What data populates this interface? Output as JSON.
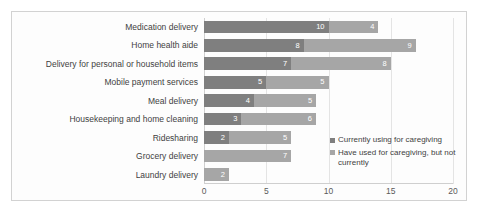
{
  "chart_data": {
    "type": "bar",
    "orientation": "horizontal",
    "stacked": true,
    "title": "",
    "subtitle": "",
    "xlabel": "",
    "ylabel": "",
    "xlim": [
      0,
      20
    ],
    "xticks": [
      0,
      5,
      10,
      15,
      20
    ],
    "grid": true,
    "legend_position": "inside-right",
    "categories": [
      "Medication delivery",
      "Home health aide",
      "Delivery for personal or household items",
      "Mobile payment services",
      "Meal delivery",
      "Housekeeping and home cleaning",
      "Ridesharing",
      "Grocery delivery",
      "Laundry delivery"
    ],
    "series": [
      {
        "name": "Currently using for caregiving",
        "color": "#7f7f7f",
        "values": [
          10,
          8,
          7,
          5,
          4,
          3,
          2,
          0,
          0
        ],
        "labels": [
          "10",
          "8",
          "7",
          "5",
          "4",
          "3",
          "2",
          "",
          ""
        ]
      },
      {
        "name": "Have used for caregiving, but not currently",
        "color": "#a6a6a6",
        "values": [
          4,
          9,
          8,
          5,
          5,
          6,
          5,
          7,
          2
        ],
        "labels": [
          "4",
          "9",
          "8",
          "5",
          "5",
          "6",
          "5",
          "7",
          "2"
        ]
      }
    ],
    "totals": [
      14,
      17,
      15,
      10,
      9,
      9,
      7,
      7,
      2
    ]
  },
  "legend": {
    "items": [
      {
        "label": "Currently using for caregiving",
        "color": "#7f7f7f",
        "marker": "square-marker"
      },
      {
        "label": "Have used for caregiving, but not currently",
        "color": "#a6a6a6",
        "marker": "square-marker"
      }
    ]
  },
  "colors": {
    "series_1": "#7f7f7f",
    "series_2": "#a6a6a6",
    "gridline": "#e4e4e4",
    "axis": "#cfcfcf",
    "frame_border": "#d2d2d2",
    "text": "#3f3f3f",
    "tick_text": "#5a5a5a",
    "data_label_text": "#ffffff",
    "background": "#ffffff"
  }
}
